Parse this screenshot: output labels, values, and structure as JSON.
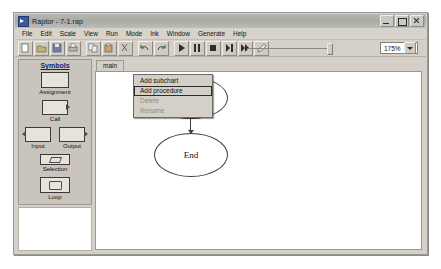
{
  "window": {
    "title": "Raptor - 7-1.rap",
    "icon": "raptor-app-icon",
    "controls": [
      {
        "name": "minimize",
        "glyph": "minimize-icon"
      },
      {
        "name": "maximize",
        "glyph": "maximize-icon"
      },
      {
        "name": "close",
        "glyph": "close-icon"
      }
    ]
  },
  "menubar": {
    "items": [
      {
        "label": "File"
      },
      {
        "label": "Edit"
      },
      {
        "label": "Scale"
      },
      {
        "label": "View"
      },
      {
        "label": "Run"
      },
      {
        "label": "Mode"
      },
      {
        "label": "Ink"
      },
      {
        "label": "Window"
      },
      {
        "label": "Generate"
      },
      {
        "label": "Help"
      }
    ]
  },
  "toolbar": {
    "buttons": [
      {
        "name": "new-icon"
      },
      {
        "name": "open-icon"
      },
      {
        "name": "save-icon"
      },
      {
        "name": "print-icon"
      },
      {
        "name": "copy-icon"
      },
      {
        "name": "paste-icon"
      },
      {
        "name": "cut-icon"
      },
      {
        "name": "undo-icon"
      },
      {
        "name": "redo-icon"
      },
      {
        "name": "play-icon"
      },
      {
        "name": "pause-icon"
      },
      {
        "name": "stop-icon"
      },
      {
        "name": "step-icon"
      },
      {
        "name": "fast-forward-icon"
      },
      {
        "name": "pen-icon"
      }
    ],
    "zoom": {
      "value": "175%",
      "slider_name": "zoom-slider"
    }
  },
  "sidebar": {
    "title": "Symbols",
    "items": [
      {
        "label": "Assignment",
        "shape": "rectangle-symbol"
      },
      {
        "label": "Call",
        "shape": "call-symbol"
      },
      {
        "label": "Input",
        "shape": "input-symbol"
      },
      {
        "label": "Output",
        "shape": "output-symbol"
      },
      {
        "label": "Selection",
        "shape": "diamond-symbol"
      },
      {
        "label": "Loop",
        "shape": "loop-symbol"
      }
    ]
  },
  "workspace": {
    "tabs": [
      {
        "label": "main",
        "active": true
      }
    ],
    "flowchart": {
      "nodes": [
        {
          "label": "Start",
          "type": "terminal"
        },
        {
          "label": "End",
          "type": "terminal"
        }
      ]
    }
  },
  "context_menu": {
    "items": [
      {
        "label": "Add subchart",
        "state": "normal"
      },
      {
        "label": "Add procedure",
        "state": "highlighted"
      },
      {
        "label": "Delete",
        "state": "disabled"
      },
      {
        "label": "Rename",
        "state": "disabled"
      }
    ]
  }
}
